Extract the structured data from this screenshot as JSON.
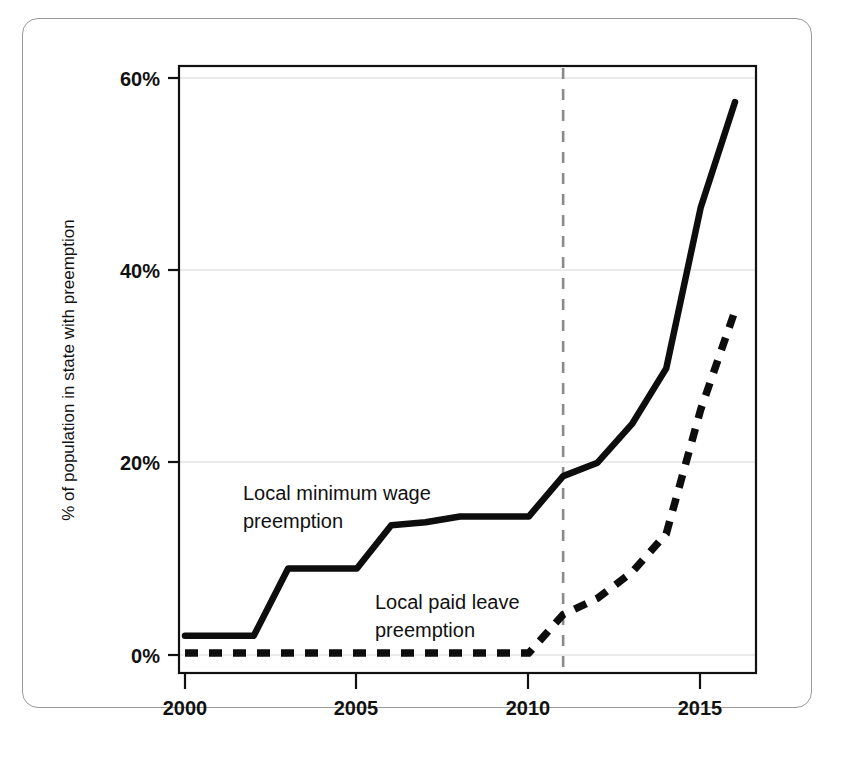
{
  "figure": {
    "background": "#ffffff",
    "border_color": "#9a9a9a"
  },
  "chart_data": {
    "type": "line",
    "title": "",
    "xlabel": "",
    "ylabel": "% of population in state with preemption",
    "xlim": [
      2000,
      2016
    ],
    "ylim": [
      0,
      60
    ],
    "xticks": [
      "2000",
      "2005",
      "2010",
      "2015"
    ],
    "xtick_values": [
      2000,
      2005,
      2010,
      2015
    ],
    "yticks": [
      "0%",
      "20%",
      "40%",
      "60%"
    ],
    "ytick_values": [
      0,
      20,
      40,
      60
    ],
    "grid": "horizontal",
    "legend_position": "inline-annotations",
    "x": [
      2000,
      2001,
      2002,
      2003,
      2004,
      2005,
      2006,
      2007,
      2008,
      2009,
      2010,
      2011,
      2012,
      2013,
      2014,
      2015,
      2016
    ],
    "series": [
      {
        "name": "Local minimum wage preemption",
        "style": "solid",
        "color": "#0d0d0d",
        "values": [
          2.0,
          2.0,
          2.0,
          9.0,
          9.0,
          9.0,
          13.5,
          13.8,
          14.4,
          14.4,
          14.4,
          18.6,
          20.0,
          24.0,
          29.8,
          46.5,
          57.5
        ],
        "annotation": {
          "line1": "Local minimum wage",
          "line2": "preemption",
          "x": 2001.8,
          "y": 26.0
        }
      },
      {
        "name": "Local paid leave preemption",
        "style": "dashed",
        "color": "#0d0d0d",
        "values": [
          0.2,
          0.2,
          0.2,
          0.2,
          0.2,
          0.2,
          0.2,
          0.2,
          0.2,
          0.2,
          0.2,
          4.2,
          5.9,
          8.6,
          12.6,
          25.5,
          35.8
        ],
        "annotation": {
          "line1": "Local paid leave",
          "line2": "preemption",
          "x": 2006.1,
          "y": 9.2
        }
      }
    ],
    "reference_line": {
      "name": "vertical-reference-2011",
      "orientation": "vertical",
      "x": 2011,
      "style": "dashed",
      "color": "#8a8a8a"
    }
  }
}
